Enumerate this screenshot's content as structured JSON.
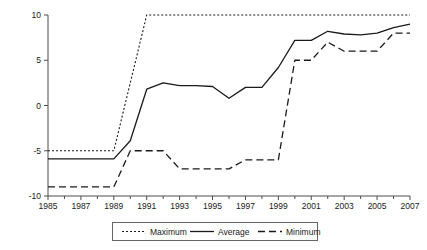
{
  "chart_data": {
    "type": "line",
    "title": "",
    "subtitle": "",
    "xlabel": "",
    "ylabel": "",
    "x": [
      1985,
      1986,
      1987,
      1988,
      1989,
      1990,
      1991,
      1992,
      1993,
      1994,
      1995,
      1996,
      1997,
      1998,
      1999,
      2000,
      2001,
      2002,
      2003,
      2004,
      2005,
      2006,
      2007
    ],
    "xlim": [
      1985,
      2007
    ],
    "ylim": [
      -10,
      10
    ],
    "ytick_labels": [
      "10",
      "5",
      "0",
      "-5",
      "-10"
    ],
    "ytick_values": [
      10,
      5,
      0,
      -5,
      -10
    ],
    "xtick_labels": [
      "1985",
      "1987",
      "1989",
      "1991",
      "1993",
      "1995",
      "1997",
      "1999",
      "2001",
      "2003",
      "2005",
      "2007"
    ],
    "xtick_values": [
      1985,
      1987,
      1989,
      1991,
      1993,
      1995,
      1997,
      1999,
      2001,
      2003,
      2005,
      2007
    ],
    "xminor_values": [
      1986,
      1988,
      1990,
      1992,
      1994,
      1996,
      1998,
      2000,
      2002,
      2004,
      2006
    ],
    "grid": false,
    "legend_position": "bottom",
    "series": [
      {
        "name": "Maximum",
        "style": "dotted",
        "color": "#1a1a1a",
        "values": [
          -5,
          -5,
          -5,
          -5,
          -5,
          2.5,
          10,
          10,
          10,
          10,
          10,
          10,
          10,
          10,
          10,
          10,
          10,
          10,
          10,
          10,
          10,
          10,
          10
        ]
      },
      {
        "name": "Average",
        "style": "solid",
        "color": "#1a1a1a",
        "values": [
          -5.9,
          -5.9,
          -5.9,
          -5.9,
          -5.9,
          -3.9,
          1.8,
          2.5,
          2.2,
          2.2,
          2.1,
          0.8,
          2.0,
          2.0,
          4.2,
          7.2,
          7.2,
          8.2,
          7.9,
          7.8,
          8.0,
          8.6,
          9.0
        ]
      },
      {
        "name": "Minimum",
        "style": "dashed",
        "color": "#1a1a1a",
        "values": [
          -9,
          -9,
          -9,
          -9,
          -9,
          -5,
          -5,
          -5,
          -7,
          -7,
          -7,
          -7,
          -6,
          -6,
          -6,
          5,
          5,
          7,
          6,
          6,
          6,
          8,
          8
        ]
      }
    ]
  },
  "legend": {
    "entries": [
      {
        "label": "Maximum",
        "style": "dotted"
      },
      {
        "label": "Average",
        "style": "solid"
      },
      {
        "label": "Minimum",
        "style": "dashed"
      }
    ]
  },
  "axes": {
    "y_axis_name": "value-axis",
    "x_axis_name": "year-axis"
  }
}
